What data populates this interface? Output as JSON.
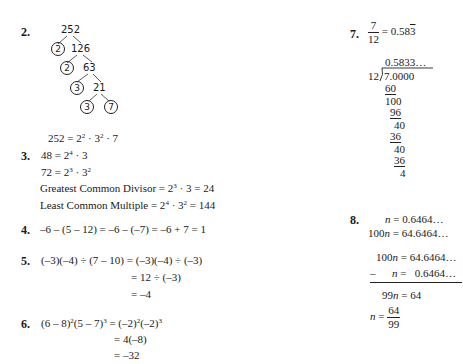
{
  "problems": {
    "p2": {
      "number": "2.",
      "tree": {
        "root": "252",
        "n126": "126",
        "n63": "63",
        "n21": "21",
        "c1": "2",
        "c2": "2",
        "c3": "3",
        "c4": "3",
        "c5": "7"
      },
      "result_lhs": "252 = 2",
      "result_exp1": "2",
      "result_mid": " · 3",
      "result_exp2": "2",
      "result_tail": " · 7"
    },
    "p3": {
      "number": "3.",
      "line1_a": "48 = 2",
      "line1_exp": "4",
      "line1_b": " · 3",
      "line2_a": "72 = 2",
      "line2_exp1": "3",
      "line2_b": " · 3",
      "line2_exp2": "2",
      "gcd_a": "Greatest Common Divisor  = 2",
      "gcd_exp": "3",
      "gcd_b": " · 3 = 24",
      "lcm_a": "Least Common Multiple  = 2",
      "lcm_exp1": "4",
      "lcm_b": " · 3",
      "lcm_exp2": "2",
      "lcm_c": " = 144"
    },
    "p4": {
      "number": "4.",
      "expr": "–6 – (5 – 12) = –6 – (–7) = –6 + 7 = 1"
    },
    "p5": {
      "number": "5.",
      "line1": "(–3)(–4) ÷ (7 – 10) = (–3)(–4) ÷ (–3)",
      "line2": "= 12 ÷ (–3)",
      "line3": "= –4"
    },
    "p6": {
      "number": "6.",
      "l1a": "(6 – 8)",
      "l1e1": "2",
      "l1b": "(5 – 7)",
      "l1e2": "3",
      "l1c": " = (–2)",
      "l1e3": "2",
      "l1d": "(–2)",
      "l1e4": "3",
      "line2": "= 4(–8)",
      "line3": "= –32"
    },
    "p7": {
      "number": "7.",
      "frac_num": "7",
      "frac_den": "12",
      "eq": "= 0.58",
      "repeat": "3",
      "quotient": "0.5833…",
      "divisor": "12",
      "dividend": "7.0000",
      "steps": [
        "60",
        "100",
        "96",
        "40",
        "36",
        "40",
        "36",
        "4"
      ]
    },
    "p8": {
      "number": "8.",
      "l1": "n = 0.6464…",
      "l2a": "100",
      "l2b": "n = 64.6464…",
      "s1a": "100",
      "s1b": "n = 64.6464…",
      "s2": "–      n =   0.6464…",
      "s3": "99n = 64",
      "final_lhs": "n =",
      "final_num": "64",
      "final_den": "99"
    }
  }
}
